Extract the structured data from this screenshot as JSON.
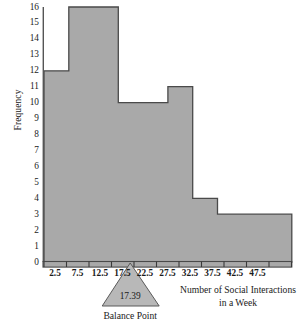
{
  "chart_data": {
    "type": "bar",
    "title": "",
    "subtitle": "",
    "xlabel_line1": "Number of Social Interactions",
    "xlabel_line2": "in a Week",
    "ylabel": "Frequency",
    "grid": false,
    "legend": "none",
    "bin_width": 5,
    "bin_edges": [
      0,
      5,
      10,
      15,
      20,
      25,
      30,
      35,
      40,
      45,
      50
    ],
    "categories": [
      "0-5",
      "5-10",
      "10-15",
      "15-20",
      "20-25",
      "25-30",
      "30-35",
      "35-40",
      "40-45",
      "45-50"
    ],
    "bin_midpoints": [
      2.5,
      7.5,
      12.5,
      17.5,
      22.5,
      27.5,
      32.5,
      37.5,
      42.5,
      47.5
    ],
    "values": [
      12,
      16,
      16,
      10,
      10,
      11,
      4,
      3,
      3,
      3
    ],
    "x_tick_labels": [
      "2.5",
      "7.5",
      "12.5",
      "17.5",
      "22.5",
      "27.5",
      "32.5",
      "37.5",
      "42.5",
      "47.5"
    ],
    "y_tick_labels": [
      "0",
      "1",
      "2",
      "3",
      "4",
      "5",
      "6",
      "7",
      "8",
      "9",
      "10",
      "11",
      "12",
      "13",
      "14",
      "15",
      "16"
    ],
    "ylim": [
      0,
      16
    ],
    "xlim": [
      0,
      50
    ],
    "annotations": [
      {
        "name": "balance-point",
        "value": "17.39",
        "caption": "Balance Point",
        "x": 17.39
      }
    ],
    "colors": {
      "bar_fill": "#a9a9a9",
      "bar_stroke": "#4a4a4a",
      "axis": "#555555",
      "text": "#1a1a1a",
      "annotation_fill": "#b8b8b8"
    }
  }
}
